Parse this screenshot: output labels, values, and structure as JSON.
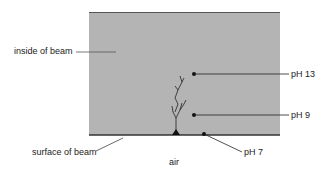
{
  "diagram": {
    "colors": {
      "beam": "#b4b4b4",
      "edge": "#555555",
      "line": "#333333"
    },
    "labels": {
      "inside": "inside of beam",
      "surface": "surface of beam",
      "air": "air",
      "ph13": "pH 13",
      "ph9": "pH 9",
      "ph7": "pH 7"
    }
  }
}
